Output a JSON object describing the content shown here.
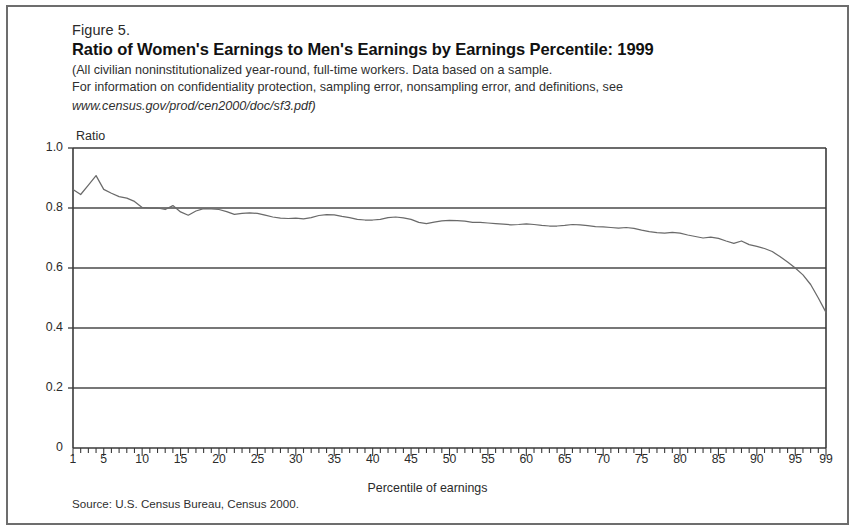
{
  "figure": {
    "number": "Figure 5.",
    "title": "Ratio of Women's Earnings to Men's Earnings by Earnings Percentile: 1999",
    "subtitle_line1": "(All civilian noninstitutionalized year-round, full-time workers.  Data based on a sample.",
    "subtitle_line2": "For information on confidentiality protection, sampling error, nonsampling error, and definitions, see",
    "subtitle_line3": "www.census.gov/prod/cen2000/doc/sf3.pdf)",
    "source": "Source: U.S. Census Bureau, Census 2000."
  },
  "axes": {
    "y_axis_unit_label": "Ratio",
    "x_axis_title": "Percentile of earnings",
    "y_tick_labels": [
      "1.0",
      "0.8",
      "0.6",
      "0.4",
      "0.2",
      "0"
    ],
    "x_tick_labels": [
      "1",
      "5",
      "10",
      "15",
      "20",
      "25",
      "30",
      "35",
      "40",
      "45",
      "50",
      "55",
      "60",
      "65",
      "70",
      "75",
      "80",
      "85",
      "90",
      "95",
      "99"
    ]
  },
  "colors": {
    "line": "#6a6a6a",
    "axis": "#3a3a3a",
    "gridline": "#4a4a4a",
    "frame": "#6d6d6d",
    "text": "#1a1a1a"
  },
  "chart_data": {
    "type": "line",
    "title": "Ratio of Women's Earnings to Men's Earnings by Earnings Percentile: 1999",
    "subtitle": "(All civilian noninstitutionalized year-round, full-time workers.  Data based on a sample. For information on confidentiality protection, sampling error, nonsampling error, and definitions, see www.census.gov/prod/cen2000/doc/sf3.pdf)",
    "xlabel": "Percentile of earnings",
    "ylabel": "Ratio",
    "xlim": [
      1,
      99
    ],
    "ylim": [
      0,
      1.0
    ],
    "y_ticks": [
      0,
      0.2,
      0.4,
      0.6,
      0.8,
      1.0
    ],
    "x_ticks": [
      1,
      5,
      10,
      15,
      20,
      25,
      30,
      35,
      40,
      45,
      50,
      55,
      60,
      65,
      70,
      75,
      80,
      85,
      90,
      95,
      99
    ],
    "grid": "horizontal",
    "legend": "none",
    "source": "U.S. Census Bureau, Census 2000",
    "series": [
      {
        "name": "Ratio of women's earnings to men's earnings",
        "x": [
          1,
          2,
          3,
          4,
          5,
          6,
          7,
          8,
          9,
          10,
          11,
          12,
          13,
          14,
          15,
          16,
          17,
          18,
          19,
          20,
          21,
          22,
          23,
          24,
          25,
          26,
          27,
          28,
          29,
          30,
          31,
          32,
          33,
          34,
          35,
          36,
          37,
          38,
          39,
          40,
          41,
          42,
          43,
          44,
          45,
          46,
          47,
          48,
          49,
          50,
          51,
          52,
          53,
          54,
          55,
          56,
          57,
          58,
          59,
          60,
          61,
          62,
          63,
          64,
          65,
          66,
          67,
          68,
          69,
          70,
          71,
          72,
          73,
          74,
          75,
          76,
          77,
          78,
          79,
          80,
          81,
          82,
          83,
          84,
          85,
          86,
          87,
          88,
          89,
          90,
          91,
          92,
          93,
          94,
          95,
          96,
          97,
          98,
          99
        ],
        "values": [
          0.862,
          0.845,
          0.876,
          0.908,
          0.862,
          0.849,
          0.838,
          0.833,
          0.822,
          0.802,
          0.8,
          0.8,
          0.795,
          0.808,
          0.787,
          0.776,
          0.79,
          0.798,
          0.797,
          0.795,
          0.788,
          0.779,
          0.782,
          0.784,
          0.782,
          0.776,
          0.77,
          0.766,
          0.765,
          0.766,
          0.764,
          0.768,
          0.775,
          0.778,
          0.777,
          0.772,
          0.768,
          0.762,
          0.76,
          0.76,
          0.762,
          0.768,
          0.77,
          0.767,
          0.762,
          0.752,
          0.748,
          0.753,
          0.757,
          0.759,
          0.758,
          0.756,
          0.752,
          0.752,
          0.75,
          0.748,
          0.746,
          0.744,
          0.745,
          0.747,
          0.745,
          0.742,
          0.74,
          0.74,
          0.742,
          0.745,
          0.744,
          0.741,
          0.738,
          0.737,
          0.735,
          0.733,
          0.735,
          0.732,
          0.726,
          0.721,
          0.718,
          0.716,
          0.719,
          0.716,
          0.71,
          0.705,
          0.7,
          0.703,
          0.699,
          0.69,
          0.682,
          0.69,
          0.678,
          0.672,
          0.665,
          0.655,
          0.638,
          0.62,
          0.6,
          0.577,
          0.545,
          0.5,
          0.452
        ]
      }
    ]
  }
}
